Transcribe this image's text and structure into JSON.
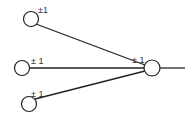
{
  "diagram": {
    "type": "neural-network-node",
    "colors": {
      "stroke": "#222222",
      "background": "#ffffff",
      "label": "#333333"
    },
    "inputs": [
      {
        "id": "input-1",
        "label": "±1",
        "cx": 31,
        "cy": 19
      },
      {
        "id": "input-2",
        "label": "± 1",
        "cx": 22,
        "cy": 68
      },
      {
        "id": "input-3",
        "label": "± 1",
        "cx": 29,
        "cy": 104
      }
    ],
    "output": {
      "id": "output-node",
      "label": "± 1",
      "cx": 152,
      "cy": 68
    }
  }
}
